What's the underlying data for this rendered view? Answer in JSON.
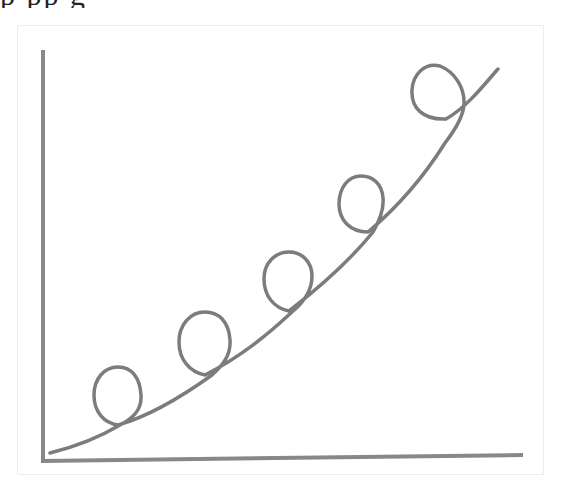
{
  "page": {
    "cutoff_caption": "p  pp                                      g"
  },
  "figure": {
    "stroke_color": "#7a7a7a",
    "axis_color": "#888888",
    "background": "#ffffff",
    "loop_count": 5
  }
}
